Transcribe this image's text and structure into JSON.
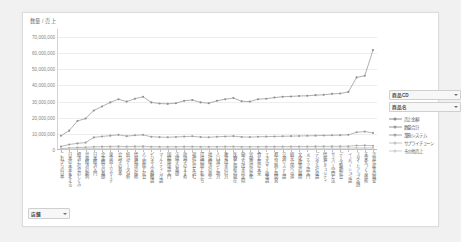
{
  "chart_data": {
    "type": "line",
    "title": "",
    "ylabel": "数量 / 売上",
    "xlabel": "",
    "ylim": [
      0,
      75000000
    ],
    "grid": true,
    "legend_position": "right",
    "ytick_labels": [
      "70,000,000",
      "60,000,000",
      "50,000,000",
      "40,000,000",
      "30,000,000",
      "20,000,000",
      "10,000,000",
      "0"
    ],
    "ytick_values": [
      70000000,
      60000000,
      50000000,
      40000000,
      30000000,
      20000000,
      10000000,
      0
    ],
    "categories": [
      "これからの日本",
      "日本の未来を考える",
      "経済と社会のしくみ",
      "世界経済の動向",
      "日本経済入門",
      "企業経営の基礎",
      "東京商工リサーチ",
      "会計学の基本",
      "統計データ分析",
      "情報処理の技術",
      "人工知能と社会",
      "ビジネス実務概論",
      "マーケティング論",
      "国際関係論入門",
      "法律学の基礎",
      "政治学のすすめ",
      "現代社会を読む",
      "環境問題と私たち",
      "地域経済の再生",
      "人口減少と地方",
      "教育改革の行方",
      "医療と福祉の現在",
      "働き方改革の実際",
      "労働市場の変化",
      "食と農の未来",
      "エネルギー政策論",
      "都市計画と再開発",
      "交通システム論",
      "観光立国への道",
      "文化政策の展開",
      "メディア論入門",
      "デジタル社会論",
      "情報セキュリティ",
      "サイバー空間と法",
      "データ駆動社会",
      "イノベーション論",
      "スタートアップ実践",
      "未来をつくる技術",
      "次世代産業の展望"
    ],
    "series": [
      {
        "name": "売上金額",
        "color": "#8e8e8e",
        "values": [
          8800000,
          12000000,
          18000000,
          19500000,
          24500000,
          27000000,
          29500000,
          31500000,
          30000000,
          31800000,
          33000000,
          29500000,
          28800000,
          28600000,
          29000000,
          30500000,
          31000000,
          29500000,
          29000000,
          30500000,
          31500000,
          32200000,
          30200000,
          30000000,
          31500000,
          31800000,
          32500000,
          33000000,
          33200000,
          33500000,
          33600000,
          34000000,
          34200000,
          34800000,
          35000000,
          36000000,
          45000000,
          46000000,
          62000000
        ]
      },
      {
        "name": "数量合計",
        "color": "#9a9a9a",
        "values": [
          2200000,
          3400000,
          4100000,
          4600000,
          7800000,
          8400000,
          8900000,
          9400000,
          8600000,
          9100000,
          9400000,
          8200000,
          8000000,
          7900000,
          8100000,
          8300000,
          8500000,
          8000000,
          7900000,
          8200000,
          8400000,
          8600000,
          8100000,
          8000000,
          8200000,
          8300000,
          8400000,
          8500000,
          8600000,
          8700000,
          8800000,
          8900000,
          9000000,
          9100000,
          9200000,
          9400000,
          11000000,
          11400000,
          10600000
        ]
      },
      {
        "name": "業務システム",
        "color": "#a5a5a5",
        "values": [
          900000,
          1200000,
          1500000,
          1700000,
          2000000,
          2100000,
          2200000,
          2300000,
          2150000,
          2250000,
          2300000,
          2050000,
          2000000,
          1980000,
          2020000,
          2080000,
          2120000,
          2000000,
          1980000,
          2050000,
          2100000,
          2150000,
          2030000,
          2000000,
          2050000,
          2080000,
          2100000,
          2120000,
          2150000,
          2180000,
          2200000,
          2220000,
          2250000,
          2280000,
          2300000,
          2350000,
          2750000,
          2850000,
          2650000
        ]
      },
      {
        "name": "サプライチェーン",
        "color": "#c4c4c4",
        "values": [
          400000,
          600000,
          750000,
          850000,
          1000000,
          1050000,
          1100000,
          1150000,
          1080000,
          1120000,
          1150000,
          1020000,
          1000000,
          990000,
          1010000,
          1040000,
          1060000,
          1000000,
          990000,
          1020000,
          1050000,
          1070000,
          1010000,
          1000000,
          1020000,
          1040000,
          1050000,
          1060000,
          1070000,
          1090000,
          1100000,
          1110000,
          1120000,
          1140000,
          1150000,
          1170000,
          1380000,
          1420000,
          1330000
        ]
      },
      {
        "name": "その他売上",
        "color": "#cfcfcf",
        "values": [
          200000,
          300000,
          380000,
          420000,
          500000,
          520000,
          550000,
          570000,
          540000,
          560000,
          570000,
          510000,
          500000,
          495000,
          505000,
          520000,
          530000,
          500000,
          495000,
          510000,
          525000,
          535000,
          505000,
          500000,
          510000,
          520000,
          525000,
          530000,
          535000,
          545000,
          550000,
          555000,
          560000,
          570000,
          575000,
          585000,
          690000,
          710000,
          665000
        ]
      }
    ]
  },
  "slicers": [
    {
      "label": "商品CD"
    },
    {
      "label": "商品名"
    }
  ],
  "bottom_filter": {
    "label": "店舗"
  },
  "icons": {
    "dropdown_arrow": "chevron-down-icon"
  }
}
